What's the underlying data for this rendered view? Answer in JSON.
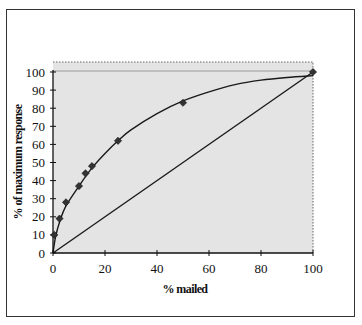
{
  "chart_data": {
    "type": "scatter",
    "title": "",
    "xlabel": "% mailed",
    "ylabel": "% of maximum response",
    "xlim": [
      0,
      100
    ],
    "ylim": [
      0,
      100
    ],
    "x_ticks": [
      0,
      20,
      40,
      60,
      80,
      100
    ],
    "y_ticks": [
      0,
      10,
      20,
      30,
      40,
      50,
      60,
      70,
      80,
      90,
      100
    ],
    "grid": false,
    "legend": null,
    "plot_background": "#e4e4e4",
    "series": [
      {
        "name": "observed",
        "kind": "markers",
        "marker": "diamond",
        "x": [
          0.5,
          2.5,
          5,
          10,
          12.5,
          15,
          25,
          50,
          100
        ],
        "y": [
          10,
          19,
          28,
          37,
          44,
          48,
          62,
          83,
          100
        ]
      },
      {
        "name": "fitted curve",
        "kind": "line",
        "x": [
          0,
          1,
          2.5,
          5,
          10,
          15,
          20,
          25,
          30,
          40,
          50,
          60,
          70,
          80,
          90,
          100
        ],
        "y": [
          0,
          9,
          17,
          26,
          37,
          47,
          55,
          62,
          68,
          77,
          84,
          89,
          93,
          95.5,
          97,
          98
        ]
      },
      {
        "name": "random (diagonal)",
        "kind": "line",
        "x": [
          0,
          100
        ],
        "y": [
          0,
          100
        ]
      }
    ]
  },
  "labels": {
    "x_axis_title": "% mailed",
    "y_axis_title": "% of maximum response"
  }
}
